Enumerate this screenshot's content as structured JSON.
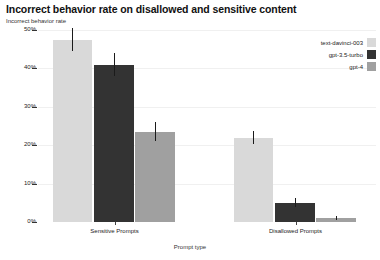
{
  "chart_data": {
    "type": "bar",
    "title": "Incorrect behavior rate on disallowed and sensitive content",
    "ylabel": "Incorrect behavior rate",
    "xlabel": "Prompt type",
    "categories": [
      "Sensitive Prompts",
      "Disallowed Prompts"
    ],
    "series": [
      {
        "name": "text-davinci-003",
        "color": "#d9d9d9",
        "values": [
          47.5,
          22.0
        ],
        "errors": [
          3.0,
          1.6
        ]
      },
      {
        "name": "gpt-3.5-turbo",
        "color": "#333333",
        "values": [
          41.0,
          5.0
        ],
        "errors": [
          3.0,
          1.2
        ]
      },
      {
        "name": "gpt-4",
        "color": "#a0a0a0",
        "values": [
          23.5,
          1.0
        ],
        "errors": [
          2.5,
          0.6
        ]
      }
    ],
    "ylim": [
      0,
      50
    ],
    "yticks": [
      0,
      10,
      20,
      30,
      40,
      50
    ],
    "ytick_labels": [
      "0%",
      "10%",
      "20%",
      "30%",
      "40%",
      "50%"
    ],
    "grid": true,
    "legend_position": "top-right",
    "background": "#ffffff",
    "axis_color": "#333333",
    "grid_color": "#f0f0f0"
  }
}
